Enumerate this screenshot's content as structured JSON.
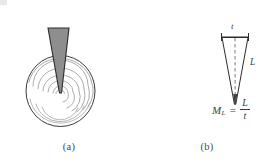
{
  "figure": {
    "background_color": "#ffffff",
    "width": 276,
    "height": 166
  },
  "panel_a": {
    "caption": "(a)",
    "description": "Indenter wedge producing concentric Hertzian cone-crack ring pattern in circular specimen",
    "wedge": {
      "fill_color": "#8e8e8e",
      "stroke_color": "#2b2b2b",
      "top_left_x": 48,
      "top_right_x": 69,
      "top_y": 28,
      "tip_x": 60,
      "tip_y": 93
    },
    "specimen_circle": {
      "center_x": 60,
      "center_y": 91,
      "radius": 35,
      "stroke_color": "#3a3a3a"
    },
    "ring_count": 6,
    "ring_color": "#9a9a9a"
  },
  "panel_b": {
    "caption": "(b)",
    "description": "Cone geometry with top width t and slant length L",
    "labels": {
      "width": "t",
      "length": "L"
    },
    "cone": {
      "top_left_x": 84,
      "top_right_x": 110,
      "top_y": 37,
      "tip_x": 97,
      "tip_y": 104,
      "stroke_color": "#2b2b2b",
      "centerline_style": "dashed"
    },
    "formula": {
      "symbol": "M",
      "subscript": "L",
      "equals": "=",
      "numerator": "L",
      "denominator": "t",
      "full_text": "M_L = L/t"
    }
  }
}
